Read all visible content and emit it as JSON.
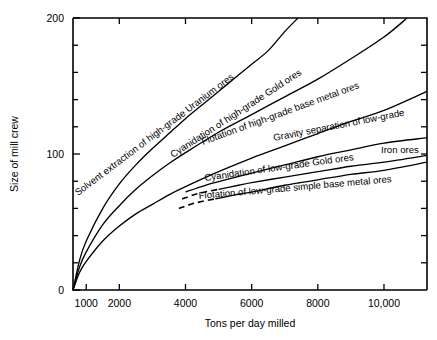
{
  "chart_data": {
    "type": "line",
    "title": "",
    "xlabel": "Tons per day milled",
    "ylabel": "Size of mill crew",
    "xlim": [
      600,
      11300
    ],
    "ylim": [
      0,
      200
    ],
    "grid": false,
    "legend_position": "inline-labels",
    "xticks": [
      1000,
      2000,
      4000,
      6000,
      8000,
      10000
    ],
    "xticklabels": [
      "1000",
      "2000",
      "4000",
      "6000",
      "8000",
      "10,000"
    ],
    "yticks": [
      0,
      20,
      40,
      60,
      80,
      100,
      120,
      140,
      160,
      180,
      200
    ],
    "yticklabels": [
      "0",
      "",
      "",
      "",
      "",
      "100",
      "",
      "",
      "",
      "",
      "200"
    ],
    "series": [
      {
        "name": "Solvent extraction of high-grade Uranium ores",
        "style": "solid",
        "x": [
          600,
          800,
          1000,
          1500,
          2000,
          2500,
          3000,
          3500,
          4000,
          4500,
          5000,
          5500,
          6000,
          6500,
          7000,
          7400
        ],
        "y": [
          0,
          22,
          36,
          60,
          78,
          92,
          104,
          115,
          126,
          136,
          146,
          156,
          166,
          176,
          190,
          200
        ]
      },
      {
        "name": "Cyanidation of high-grade Gold ores",
        "style": "solid",
        "x": [
          600,
          800,
          1000,
          1500,
          2000,
          2500,
          3000,
          3500,
          4000,
          5000,
          6000,
          7000,
          8000,
          9000,
          10000,
          10700
        ],
        "y": [
          0,
          17,
          28,
          48,
          62,
          74,
          84,
          93,
          101,
          116,
          129,
          142,
          155,
          170,
          186,
          200
        ]
      },
      {
        "name": "Flotation of high-grade base metal ores",
        "style": "solid",
        "x": [
          600,
          800,
          1000,
          1500,
          2000,
          2500,
          3000,
          3500,
          4000,
          5000,
          6000,
          7000,
          8000,
          9000,
          10000,
          11300
        ],
        "y": [
          0,
          13,
          21,
          36,
          47,
          56,
          63,
          70,
          76,
          87,
          97,
          106,
          115,
          124,
          132,
          146
        ]
      },
      {
        "name": "Gravity separation of low-grade Iron ores",
        "style": "solid",
        "x": [
          4000,
          4600,
          5200,
          6000,
          7000,
          8000,
          9000,
          10000,
          11300
        ],
        "y": [
          72,
          77,
          81,
          86,
          92,
          98,
          103,
          108,
          112
        ]
      },
      {
        "name": "Cyanidation of low-grade Gold ores",
        "style": "dashed-then-solid",
        "x": [
          3900,
          4400,
          5000,
          5600,
          6000,
          7000,
          8000,
          9000,
          10000,
          11300
        ],
        "y": [
          67,
          71,
          74,
          77,
          79,
          83,
          87,
          91,
          94,
          99
        ]
      },
      {
        "name": "Flotation of low-grade simple base metal ores",
        "style": "dashed-then-solid",
        "x": [
          3800,
          4300,
          4900,
          5500,
          6000,
          7000,
          8000,
          9000,
          10000,
          11300
        ],
        "y": [
          60,
          64,
          67,
          70,
          72,
          77,
          81,
          85,
          88,
          94
        ]
      }
    ],
    "annotations": [
      {
        "text": "Solvent extraction of high-grade Uranium ores",
        "x_px": 78,
        "y_px": 196,
        "rotation": -37
      },
      {
        "text": "Cyanidation of high-grade Gold ores",
        "x_px": 173,
        "y_px": 158,
        "rotation": -33
      },
      {
        "text": "Flotation of high-grade base metal ores",
        "x_px": 203,
        "y_px": 145,
        "rotation": -20
      },
      {
        "text": "Gravity separation of low-grade",
        "x_px": 274,
        "y_px": 141,
        "rotation": -11
      },
      {
        "text": "Iron ores",
        "x_px": 381,
        "y_px": 153,
        "rotation": 0
      },
      {
        "text": "Cyanidation of low-grade Gold ores",
        "x_px": 205,
        "y_px": 181,
        "rotation": -8
      },
      {
        "text": "Flotation of low-grade simple base metal ores",
        "x_px": 199,
        "y_px": 199,
        "rotation": -5
      }
    ]
  }
}
